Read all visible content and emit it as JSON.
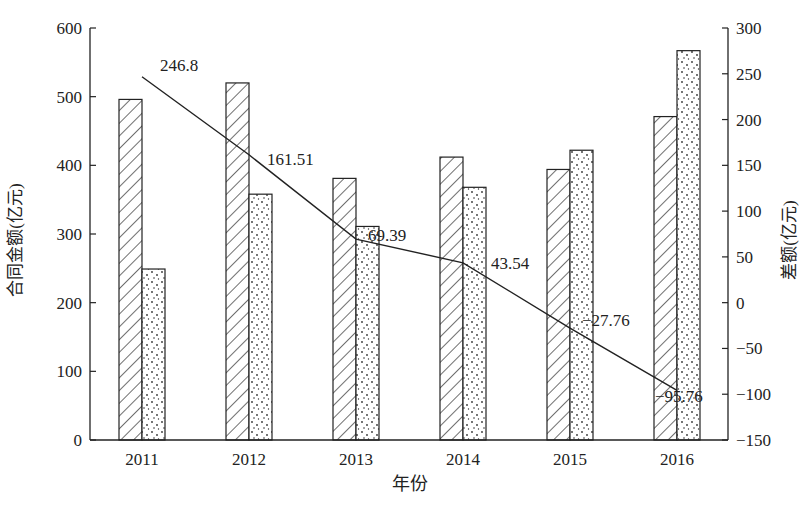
{
  "chart_data": {
    "type": "bar",
    "title": "",
    "xlabel": "年份",
    "ylabel": "合同金额(亿元)",
    "y2label": "差额(亿元)",
    "categories": [
      "2011",
      "2012",
      "2013",
      "2014",
      "2015",
      "2016"
    ],
    "ylim": [
      0,
      600
    ],
    "yticks": [
      0,
      100,
      200,
      300,
      400,
      500,
      600
    ],
    "y2lim": [
      -150,
      300
    ],
    "y2ticks": [
      -150,
      -100,
      -50,
      0,
      50,
      100,
      150,
      200,
      250,
      300
    ],
    "grid": false,
    "legend": "none",
    "series": [
      {
        "name": "合同金额(斜线)",
        "type": "bar",
        "axis": "left",
        "pattern": "hatch",
        "values": [
          496,
          520,
          381,
          412,
          394,
          471
        ]
      },
      {
        "name": "合同金额(点状)",
        "type": "bar",
        "axis": "left",
        "pattern": "dots",
        "values": [
          249,
          358,
          311,
          368,
          422,
          567
        ]
      },
      {
        "name": "差额",
        "type": "line",
        "axis": "right",
        "values": [
          246.8,
          161.51,
          69.39,
          43.54,
          -27.76,
          -95.76
        ]
      }
    ],
    "annotations": [
      "246.8",
      "161.51",
      "69.39",
      "43.54",
      "-27.76",
      "-95.76"
    ]
  }
}
